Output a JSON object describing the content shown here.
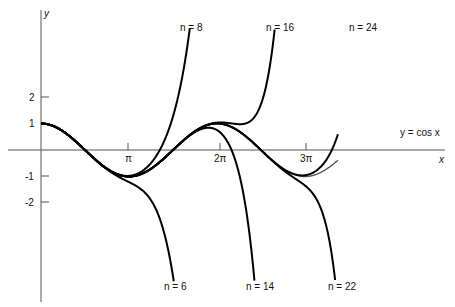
{
  "chart_data": {
    "type": "line",
    "title": "",
    "xlabel": "x",
    "ylabel": "y",
    "xlim": [
      0,
      10.6
    ],
    "ylim": [
      -4.5,
      5.6
    ],
    "grid": false,
    "x_ticks": [
      {
        "value": 3.14159,
        "label": "π"
      },
      {
        "value": 6.28319,
        "label": "2π"
      },
      {
        "value": 9.42478,
        "label": "3π"
      }
    ],
    "y_ticks": [
      {
        "value": 2,
        "label": "2"
      },
      {
        "value": 1,
        "label": "1"
      },
      {
        "value": -1,
        "label": "-1"
      },
      {
        "value": -2,
        "label": "-2"
      }
    ],
    "series": [
      {
        "name": "y = cos x",
        "label": "y = cos x",
        "color": "#555555",
        "function": "cos(x)"
      },
      {
        "name": "n = 6",
        "label": "n = 6",
        "color": "#000000",
        "taylor_degree": 6
      },
      {
        "name": "n = 8",
        "label": "n = 8",
        "color": "#000000",
        "taylor_degree": 8
      },
      {
        "name": "n = 14",
        "label": "n = 14",
        "color": "#000000",
        "taylor_degree": 14
      },
      {
        "name": "n = 16",
        "label": "n = 16",
        "color": "#000000",
        "taylor_degree": 16
      },
      {
        "name": "n = 22",
        "label": "n = 22",
        "color": "#000000",
        "taylor_degree": 22
      },
      {
        "name": "n = 24",
        "label": "n = 24",
        "color": "#000000",
        "taylor_degree": 24
      }
    ],
    "annotations": [
      "n = 8",
      "n = 16",
      "n = 24",
      "n = 6",
      "n = 14",
      "n = 22",
      "y = cos x"
    ]
  },
  "labels": {
    "y_axis": "y",
    "x_axis": "x",
    "cos_label": "y = cos x",
    "n8": "n = 8",
    "n16": "n = 16",
    "n24": "n = 24",
    "n6": "n = 6",
    "n14": "n = 14",
    "n22": "n = 22",
    "pi": "π",
    "two_pi": "2π",
    "three_pi": "3π",
    "y2": "2",
    "y1": "1",
    "ym1": "-1",
    "ym2": "-2"
  }
}
